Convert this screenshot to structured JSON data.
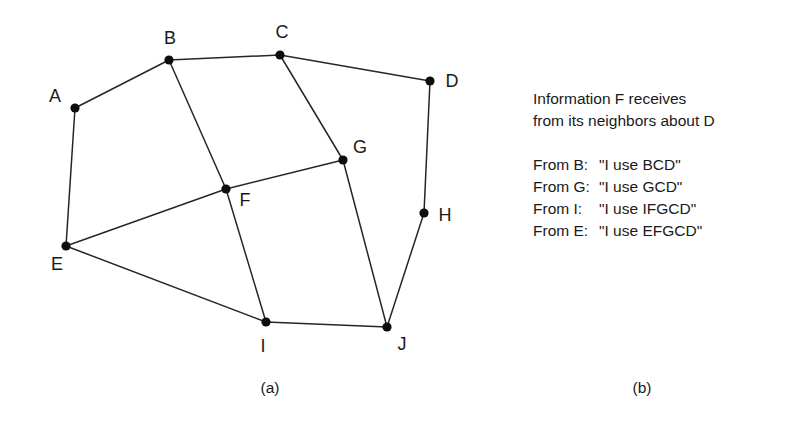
{
  "figure": {
    "panel_a": {
      "caption": "(a)",
      "graph": {
        "nodes": [
          {
            "id": "A",
            "label": "A",
            "x": 75,
            "y": 108,
            "label_x": 55,
            "label_y": 102,
            "label_anchor": "middle"
          },
          {
            "id": "B",
            "label": "B",
            "x": 169,
            "y": 60,
            "label_x": 170,
            "label_y": 44,
            "label_anchor": "middle"
          },
          {
            "id": "C",
            "label": "C",
            "x": 280,
            "y": 55,
            "label_x": 282,
            "label_y": 38,
            "label_anchor": "middle"
          },
          {
            "id": "D",
            "label": "D",
            "x": 430,
            "y": 81,
            "label_x": 452,
            "label_y": 87,
            "label_anchor": "middle"
          },
          {
            "id": "E",
            "label": "E",
            "x": 66,
            "y": 246,
            "label_x": 57,
            "label_y": 270,
            "label_anchor": "middle"
          },
          {
            "id": "F",
            "label": "F",
            "x": 226,
            "y": 189,
            "label_x": 245,
            "label_y": 206,
            "label_anchor": "middle"
          },
          {
            "id": "G",
            "label": "G",
            "x": 343,
            "y": 160,
            "label_x": 360,
            "label_y": 153,
            "label_anchor": "middle"
          },
          {
            "id": "H",
            "label": "H",
            "x": 424,
            "y": 213,
            "label_x": 445,
            "label_y": 221,
            "label_anchor": "middle"
          },
          {
            "id": "I",
            "label": "I",
            "x": 266,
            "y": 322,
            "label_x": 263,
            "label_y": 352,
            "label_anchor": "middle"
          },
          {
            "id": "J",
            "label": "J",
            "x": 387,
            "y": 327,
            "label_x": 402,
            "label_y": 350,
            "label_anchor": "middle"
          }
        ],
        "edges": [
          {
            "from": "A",
            "to": "B"
          },
          {
            "from": "B",
            "to": "C"
          },
          {
            "from": "C",
            "to": "D"
          },
          {
            "from": "D",
            "to": "H"
          },
          {
            "from": "H",
            "to": "J"
          },
          {
            "from": "A",
            "to": "E"
          },
          {
            "from": "B",
            "to": "F"
          },
          {
            "from": "C",
            "to": "G"
          },
          {
            "from": "E",
            "to": "F"
          },
          {
            "from": "F",
            "to": "G"
          },
          {
            "from": "F",
            "to": "I"
          },
          {
            "from": "G",
            "to": "J"
          },
          {
            "from": "E",
            "to": "I"
          },
          {
            "from": "I",
            "to": "J"
          }
        ],
        "node_radius": 4.6,
        "edge_color": "#262626",
        "node_color": "#0d0d0d",
        "label_color": "#1a1a1a"
      }
    },
    "panel_b": {
      "caption": "(b)",
      "heading_line_1": "Information F receives",
      "heading_line_2": "from its neighbors about D",
      "messages": [
        {
          "from": "From B:",
          "quote": "\"I use BCD\""
        },
        {
          "from": "From G:",
          "quote": "\"I use GCD\""
        },
        {
          "from": "From I:",
          "quote": "\"I use IFGCD\""
        },
        {
          "from": "From E:",
          "quote": "\"I use EFGCD\""
        }
      ]
    }
  }
}
